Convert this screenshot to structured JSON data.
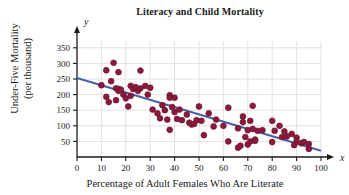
{
  "chart_data": {
    "type": "scatter",
    "title": "Literacy and Child Mortality",
    "xlabel": "Percentage of Adult Females Who Are Literate",
    "ylabel_line1": "Under-Five Mortality",
    "ylabel_line2": "(per thousand)",
    "x_axis_symbol": "x",
    "y_axis_symbol": "y",
    "xlim": [
      0,
      100
    ],
    "ylim": [
      0,
      375
    ],
    "xticks": [
      0,
      10,
      20,
      30,
      40,
      50,
      60,
      70,
      80,
      90,
      100
    ],
    "yticks": [
      50,
      100,
      150,
      200,
      250,
      300,
      350
    ],
    "grid": true,
    "legend": "none",
    "point_color": "#8B1A3A",
    "line_color": "#4A5FA5",
    "trendline": {
      "name": "Least-squares regression line",
      "x_start": 0,
      "y_start": 253,
      "x_end": 100,
      "y_end": 20
    },
    "points": [
      [
        10,
        230
      ],
      [
        12,
        278
      ],
      [
        12,
        193
      ],
      [
        13,
        176
      ],
      [
        14,
        243
      ],
      [
        15,
        302
      ],
      [
        16,
        220
      ],
      [
        16,
        182
      ],
      [
        17,
        272
      ],
      [
        17,
        218
      ],
      [
        17,
        212
      ],
      [
        18,
        216
      ],
      [
        19,
        200
      ],
      [
        20,
        188
      ],
      [
        21,
        162
      ],
      [
        22,
        228
      ],
      [
        22,
        196
      ],
      [
        23,
        218
      ],
      [
        24,
        224
      ],
      [
        25,
        212
      ],
      [
        26,
        277
      ],
      [
        26,
        220
      ],
      [
        28,
        228
      ],
      [
        29,
        200
      ],
      [
        30,
        222
      ],
      [
        31,
        152
      ],
      [
        33,
        140
      ],
      [
        34,
        124
      ],
      [
        35,
        166
      ],
      [
        36,
        150
      ],
      [
        37,
        120
      ],
      [
        38,
        198
      ],
      [
        38,
        190
      ],
      [
        38,
        87
      ],
      [
        39,
        160
      ],
      [
        40,
        190
      ],
      [
        40,
        144
      ],
      [
        41,
        122
      ],
      [
        42,
        152
      ],
      [
        43,
        118
      ],
      [
        45,
        136
      ],
      [
        46,
        110
      ],
      [
        47,
        104
      ],
      [
        48,
        106
      ],
      [
        49,
        118
      ],
      [
        50,
        162
      ],
      [
        51,
        116
      ],
      [
        52,
        70
      ],
      [
        54,
        140
      ],
      [
        56,
        98
      ],
      [
        57,
        120
      ],
      [
        60,
        100
      ],
      [
        62,
        158
      ],
      [
        62,
        50
      ],
      [
        66,
        92
      ],
      [
        66,
        30
      ],
      [
        67,
        36
      ],
      [
        68,
        130
      ],
      [
        68,
        112
      ],
      [
        69,
        64
      ],
      [
        70,
        86
      ],
      [
        70,
        40
      ],
      [
        71,
        116
      ],
      [
        71,
        50
      ],
      [
        72,
        90
      ],
      [
        72,
        164
      ],
      [
        73,
        56
      ],
      [
        73,
        52
      ],
      [
        74,
        84
      ],
      [
        76,
        86
      ],
      [
        80,
        116
      ],
      [
        80,
        48
      ],
      [
        81,
        84
      ],
      [
        83,
        100
      ],
      [
        84,
        64
      ],
      [
        85,
        82
      ],
      [
        86,
        66
      ],
      [
        88,
        74
      ],
      [
        89,
        38
      ],
      [
        90,
        62
      ],
      [
        90,
        50
      ],
      [
        92,
        44
      ],
      [
        93,
        48
      ],
      [
        95,
        42
      ],
      [
        95,
        26
      ]
    ]
  }
}
